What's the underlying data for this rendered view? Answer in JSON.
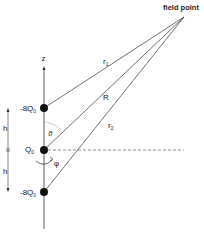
{
  "diagram": {
    "title_label": "field point",
    "axis_label": "z",
    "charges": [
      {
        "label": "-8Q",
        "subscript": "0",
        "position": "top"
      },
      {
        "label": "Q",
        "subscript": "0",
        "position": "middle"
      },
      {
        "label": "-8Q",
        "subscript": "0",
        "position": "bottom"
      }
    ],
    "distances": [
      {
        "label": "r",
        "subscript": "1"
      },
      {
        "label": "R",
        "subscript": ""
      },
      {
        "label": "r",
        "subscript": "2"
      }
    ],
    "spacing_labels": [
      "h",
      "h"
    ],
    "angles": {
      "polar": "ϑ",
      "azimuthal": "φ"
    },
    "colors": {
      "line": "#333333",
      "charge": "#111111",
      "background": "#ffffff"
    }
  }
}
